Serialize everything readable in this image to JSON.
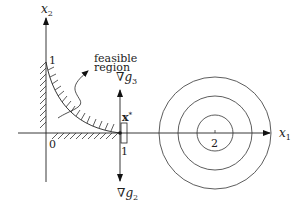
{
  "diagram": {
    "axes": {
      "x1_label": "x",
      "x1_sub": "1",
      "x2_label": "x",
      "x2_sub": "2",
      "origin_label": "0"
    },
    "ticks": {
      "x2_one": "1",
      "x1_one": "1",
      "x1_two": "2"
    },
    "annotations": {
      "feasible_line1": "feasible",
      "feasible_line2": "region",
      "optimum_label": "x",
      "optimum_sup": "*",
      "grad_g3_nabla": "∇",
      "grad_g3_g": "g",
      "grad_g3_sub": "3",
      "grad_g2_nabla": "∇",
      "grad_g2_g": "g",
      "grad_g2_sub": "2"
    },
    "contours": {
      "center_label": "2",
      "count": 3
    },
    "colors": {
      "stroke": "#222222",
      "background": "#ffffff"
    }
  }
}
